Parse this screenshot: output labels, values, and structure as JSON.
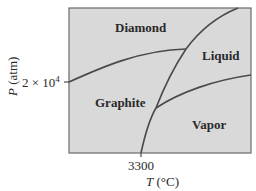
{
  "diagram": {
    "type": "phase-diagram",
    "substance": "carbon",
    "colors": {
      "background": "#d9d9d9",
      "frame": "#5a5a5a",
      "curve": "#4a4a4a",
      "text": "#2a2a2a"
    },
    "regions": {
      "diamond": "Diamond",
      "liquid": "Liquid",
      "graphite": "Graphite",
      "vapor": "Vapor"
    },
    "y_axis": {
      "label_var": "P",
      "label_unit": "(atm)",
      "tick_base": "2 × 10",
      "tick_exp": "4"
    },
    "x_axis": {
      "label_var": "T",
      "label_unit": "(°C)",
      "tick": "3300"
    }
  }
}
